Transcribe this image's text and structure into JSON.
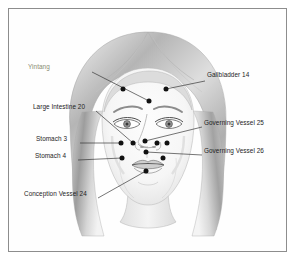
{
  "figure": {
    "border_color": "#8d8d8d",
    "background_color": "#ffffff",
    "dot_color": "#111111",
    "leader_color": "#2b2b2b",
    "label_color": "#1d1d1d",
    "muted_label_color": "#8a8c72"
  },
  "labels": [
    {
      "id": "yintang",
      "text": "Yintang",
      "side": "left",
      "style": "muted",
      "x": 60,
      "y": 69,
      "leader": [
        [
          92,
          72
        ],
        [
          149,
          101
        ]
      ],
      "point": [
        149,
        101
      ]
    },
    {
      "id": "gallbladder-14",
      "text": "Gallbladder  14",
      "side": "right",
      "style": "normal",
      "x": 207,
      "y": 77,
      "leader": [
        [
          205,
          81
        ],
        [
          166,
          89
        ]
      ],
      "point": [
        166,
        89
      ]
    },
    {
      "id": "large-intestine-20",
      "text": "Large Intestine 20",
      "side": "left",
      "style": "normal",
      "x": 35,
      "y": 108,
      "leader": [
        [
          96,
          111
        ],
        [
          133,
          143
        ]
      ],
      "point": [
        133,
        143
      ]
    },
    {
      "id": "governing-vessel-25",
      "text": "Governing Vessel 25",
      "side": "right",
      "style": "normal",
      "x": 204,
      "y": 125,
      "leader": [
        [
          202,
          127
        ],
        [
          145,
          141
        ]
      ],
      "point": [
        145,
        141
      ]
    },
    {
      "id": "stomach-3",
      "text": "Stomach 3",
      "side": "left",
      "style": "normal",
      "x": 43,
      "y": 140,
      "leader": [
        [
          80,
          143
        ],
        [
          121,
          143
        ]
      ],
      "point": [
        121,
        143
      ]
    },
    {
      "id": "governing-vessel-26",
      "text": "Governing Vessel 26",
      "side": "right",
      "style": "normal",
      "x": 204,
      "y": 153,
      "leader": [
        [
          202,
          155
        ],
        [
          146,
          152
        ]
      ],
      "point": [
        146,
        152
      ]
    },
    {
      "id": "stomach-4",
      "text": "Stomach 4",
      "side": "left",
      "style": "normal",
      "x": 42,
      "y": 158,
      "leader": [
        [
          78,
          160
        ],
        [
          122,
          158
        ]
      ],
      "point": [
        122,
        158
      ]
    },
    {
      "id": "conception-vessel-24",
      "text": "Conception Vessel 24",
      "side": "left",
      "style": "normal",
      "x": 31,
      "y": 196,
      "leader": [
        [
          98,
          198
        ],
        [
          146,
          171
        ]
      ],
      "point": [
        146,
        171
      ]
    }
  ],
  "points": [
    {
      "id": "pt-yintang",
      "x": 149,
      "y": 101,
      "r": 2.5
    },
    {
      "id": "pt-gallbladder-14",
      "x": 166,
      "y": 89,
      "r": 2.5
    },
    {
      "id": "pt-forehead-left",
      "x": 123,
      "y": 89,
      "r": 2.5
    },
    {
      "id": "pt-large-intestine-20",
      "x": 133,
      "y": 143,
      "r": 2.5
    },
    {
      "id": "pt-stomach-3",
      "x": 121,
      "y": 143,
      "r": 2.5
    },
    {
      "id": "pt-governing-vessel-25-a",
      "x": 145,
      "y": 141,
      "r": 2.5
    },
    {
      "id": "pt-nose-right-a",
      "x": 157,
      "y": 143,
      "r": 2.5
    },
    {
      "id": "pt-nose-right-b",
      "x": 167,
      "y": 143,
      "r": 2.5
    },
    {
      "id": "pt-governing-vessel-26",
      "x": 146,
      "y": 152,
      "r": 2.5
    },
    {
      "id": "pt-stomach-4",
      "x": 122,
      "y": 158,
      "r": 2.5
    },
    {
      "id": "pt-stomach-4-right",
      "x": 163,
      "y": 158,
      "r": 2.5
    },
    {
      "id": "pt-conception-vessel-24",
      "x": 146,
      "y": 171,
      "r": 2.5
    }
  ]
}
